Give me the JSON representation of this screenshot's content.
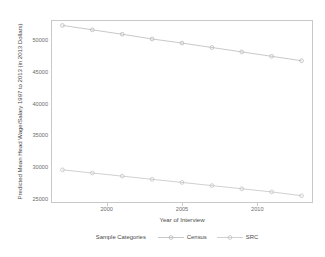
{
  "chart_data": {
    "type": "line",
    "title": "",
    "xlabel": "Year of Interview",
    "ylabel": "Predicted Mean Head Wage/Salary 1997 to 2013 (in 2013 Dollars)",
    "xlim": [
      1996.3,
      2013.7
    ],
    "ylim": [
      24400,
      53100
    ],
    "grid": false,
    "legend_position": "bottom",
    "legend_title": "Sample Categories",
    "x_ticks": [
      {
        "value": 2000,
        "label": "2000"
      },
      {
        "value": 2005,
        "label": "2005"
      },
      {
        "value": 2010,
        "label": "2010"
      }
    ],
    "y_ticks": [
      {
        "value": 50000,
        "label": "50000"
      },
      {
        "value": 45000,
        "label": "45000"
      },
      {
        "value": 40000,
        "label": "40000"
      },
      {
        "value": 35000,
        "label": "35000"
      },
      {
        "value": 30000,
        "label": "30000"
      },
      {
        "value": 25000,
        "label": "25000"
      }
    ],
    "x": [
      1997,
      1999,
      2001,
      2003,
      2005,
      2007,
      2009,
      2011,
      2013
    ],
    "series": [
      {
        "name": "Census",
        "color": "#b9b9b9",
        "marker": "circle",
        "values": [
          52400,
          51700,
          51000,
          50250,
          49600,
          48900,
          48200,
          47500,
          46800
        ]
      },
      {
        "name": "SRC",
        "color": "#c4c4c4",
        "marker": "circle",
        "values": [
          29500,
          29000,
          28500,
          28000,
          27500,
          27000,
          26500,
          26000,
          25400
        ]
      }
    ]
  },
  "axis_color": "#c9c9c9",
  "tick_text_color": "#6d6d6d",
  "title_text_color": "#4a4a4a"
}
